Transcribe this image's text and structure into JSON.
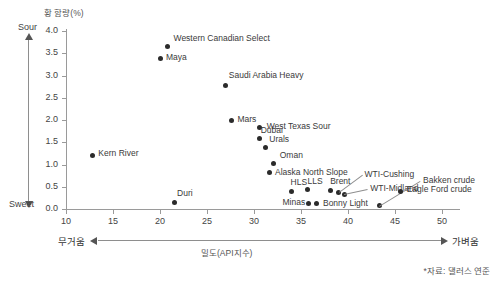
{
  "chart_data": {
    "type": "scatter",
    "title": "",
    "xlabel": "밀도(API지수)",
    "ylabel": "황 함량(%)",
    "xlim": [
      10,
      50
    ],
    "ylim": [
      0.0,
      4.0
    ],
    "xticks": [
      10,
      15,
      20,
      25,
      30,
      35,
      40,
      45,
      50
    ],
    "xtick_labels": [
      "10",
      "15",
      "20",
      "25",
      "30",
      "35",
      "40",
      "45",
      "50"
    ],
    "yticks": [
      0.0,
      0.5,
      1.0,
      1.5,
      2.0,
      2.5,
      3.0,
      3.5,
      4.0
    ],
    "ytick_labels": [
      "0.0",
      "0.5",
      "1.0",
      "1.5",
      "2.0",
      "2.5",
      "3.0",
      "3.5",
      "4.0"
    ],
    "grid": false,
    "legend": "none",
    "axis_arrow_labels": {
      "y_top": "Sour",
      "y_bottom": "Sweet",
      "x_left": "무거움",
      "x_right": "가벼움"
    },
    "source_note": "*자료: 댈러스 연준",
    "points": [
      {
        "name": "Western Canadian Select",
        "x": 20.8,
        "y": 3.65,
        "label_dx": 6,
        "label_dy": -11,
        "leader": false
      },
      {
        "name": "Maya",
        "x": 20.0,
        "y": 3.38,
        "label_dx": 6,
        "label_dy": -4,
        "leader": false
      },
      {
        "name": "Saudi Arabia Heavy",
        "x": 27.0,
        "y": 2.78,
        "label_dx": 3,
        "label_dy": -12,
        "leader": false
      },
      {
        "name": "Mars",
        "x": 27.6,
        "y": 1.98,
        "label_dx": 6,
        "label_dy": -4,
        "leader": false
      },
      {
        "name": "West Texas Sour",
        "x": 30.6,
        "y": 1.83,
        "label_dx": 7,
        "label_dy": -4,
        "leader": false
      },
      {
        "name": "Dubai",
        "x": 30.6,
        "y": 1.58,
        "label_dx": 1,
        "label_dy": -11,
        "leader": false
      },
      {
        "name": "Urals",
        "x": 31.2,
        "y": 1.38,
        "label_dx": 4,
        "label_dy": -11,
        "leader": false
      },
      {
        "name": "Oman",
        "x": 32.1,
        "y": 1.02,
        "label_dx": 6,
        "label_dy": -11,
        "leader": false
      },
      {
        "name": "Alaska North Slope",
        "x": 31.6,
        "y": 0.82,
        "label_dx": 6,
        "label_dy": -3,
        "leader": false
      },
      {
        "name": "HLS",
        "x": 34.0,
        "y": 0.4,
        "label_dx": -1,
        "label_dy": -11,
        "leader": false
      },
      {
        "name": "LLS",
        "x": 35.7,
        "y": 0.43,
        "label_dx": 0,
        "label_dy": -11,
        "leader": false
      },
      {
        "name": "Brent",
        "x": 38.1,
        "y": 0.42,
        "label_dx": 0,
        "label_dy": -11,
        "leader": false
      },
      {
        "name": "Minas",
        "x": 35.8,
        "y": 0.12,
        "label_dx": -26,
        "label_dy": -4,
        "leader": false
      },
      {
        "name": "Bonny Light",
        "x": 36.7,
        "y": 0.12,
        "label_dx": 6,
        "label_dy": -3,
        "leader": false
      },
      {
        "name": "Kern River",
        "x": 12.8,
        "y": 1.2,
        "label_dx": 6,
        "label_dy": -5,
        "leader": false
      },
      {
        "name": "Duri",
        "x": 21.5,
        "y": 0.15,
        "label_dx": 3,
        "label_dy": -11,
        "leader": false
      },
      {
        "name": "WTI-Cushing",
        "x": 39.0,
        "y": 0.38,
        "label_dx": 26,
        "label_dy": -20,
        "leader": true
      },
      {
        "name": "WTI-Midland",
        "x": 39.6,
        "y": 0.33,
        "label_dx": 26,
        "label_dy": -8,
        "leader": true
      },
      {
        "name": "Bakken crude",
        "x": 43.3,
        "y": 0.07,
        "label_dx": 44,
        "label_dy": -28,
        "leader": true
      },
      {
        "name": "Eagle Ford crude",
        "x": 45.6,
        "y": 0.4,
        "label_dx": 6,
        "label_dy": -4,
        "leader": false
      }
    ]
  }
}
